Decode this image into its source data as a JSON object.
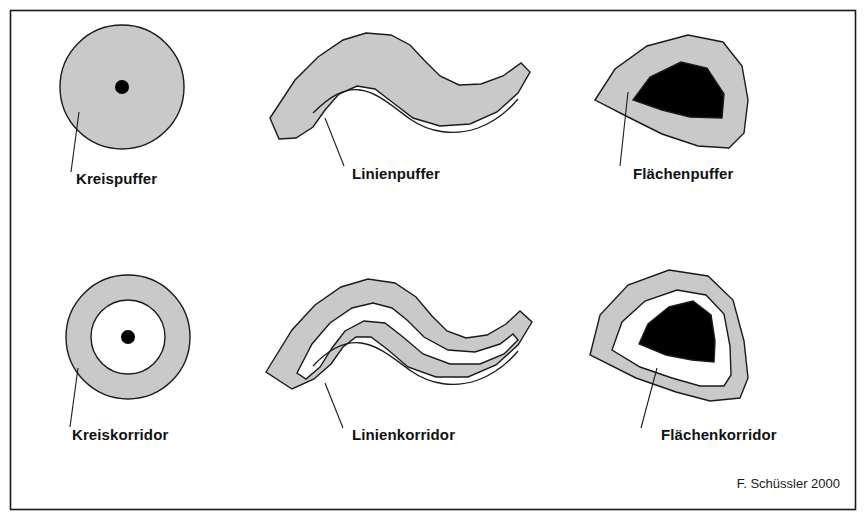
{
  "figure": {
    "credit": "F. Schüssler 2000",
    "colors": {
      "buffer_fill": "#c9c9c9",
      "core_fill": "#000000",
      "corridor_gap_fill": "#ffffff",
      "outline": "#1a1a1a",
      "background": "#ffffff",
      "frame": "#1a1a1a"
    },
    "frame": {
      "x": 10,
      "y": 10,
      "width": 846,
      "height": 500
    }
  },
  "panels": [
    {
      "id": "kreispuffer",
      "label": "Kreispuffer",
      "row": "buffer",
      "geometry_type": "point-buffer",
      "label_x": 76,
      "label_y": 184,
      "leader": {
        "x1": 79,
        "y1": 112,
        "x2": 71,
        "y2": 172
      },
      "circle": {
        "cx": 122,
        "cy": 87,
        "r": 62
      },
      "point": {
        "cx": 122,
        "cy": 87,
        "r": 7
      }
    },
    {
      "id": "linienpuffer",
      "label": "Linienpuffer",
      "row": "buffer",
      "geometry_type": "line-buffer",
      "label_x": 352,
      "label_y": 179,
      "leader": {
        "x1": 325,
        "y1": 118,
        "x2": 344,
        "y2": 166
      }
    },
    {
      "id": "flaechenpuffer",
      "label": "Flächenpuffer",
      "row": "buffer",
      "geometry_type": "polygon-buffer",
      "label_x": 633,
      "label_y": 179,
      "leader": {
        "x1": 628,
        "y1": 92,
        "x2": 620,
        "y2": 166
      }
    },
    {
      "id": "kreiskorridor",
      "label": "Kreiskorridor",
      "row": "corridor",
      "geometry_type": "point-corridor",
      "label_x": 72,
      "label_y": 440,
      "leader": {
        "x1": 78,
        "y1": 368,
        "x2": 70,
        "y2": 427
      },
      "circle_outer": {
        "cx": 128,
        "cy": 337,
        "r": 62
      },
      "circle_inner": {
        "cx": 128,
        "cy": 337,
        "r": 37
      },
      "point": {
        "cx": 128,
        "cy": 337,
        "r": 7
      }
    },
    {
      "id": "linienkorridor",
      "label": "Linienkorridor",
      "row": "corridor",
      "geometry_type": "line-corridor",
      "label_x": 352,
      "label_y": 440,
      "leader": {
        "x1": 325,
        "y1": 383,
        "x2": 343,
        "y2": 428
      }
    },
    {
      "id": "flaechenkorridor",
      "label": "Flächenkorridor",
      "row": "corridor",
      "geometry_type": "polygon-corridor",
      "label_x": 661,
      "label_y": 440,
      "leader": {
        "x1": 657,
        "y1": 368,
        "x2": 641,
        "y2": 428
      }
    }
  ],
  "paths": {
    "line_buffer_outer": "M 270 118 L 295 80 L 318 57 L 343 40 L 366 33 L 391 35 L 410 45 L 424 60 L 440 76 L 459 85 L 481 84 L 503 76 L 521 63 L 530 72 L 518 93 L 497 112 L 470 124 L 440 126 L 413 118 L 392 102 L 375 89 L 357 86 L 339 94 L 325 110 L 313 127 L 296 138 L 279 139 Z",
    "line_buffer_centerline": "M 313 113 C 330 96 344 88 360 90 C 377 92 392 106 410 119 C 430 133 455 136 478 128 C 494 122 508 111 518 99",
    "line_corridor_outer": "M 266 372 L 292 330 L 315 305 L 341 287 L 368 279 L 395 283 L 416 297 L 432 316 L 447 331 L 466 338 L 487 335 L 506 324 L 520 311 L 532 322 L 518 345 L 496 365 L 468 377 L 436 377 L 408 367 L 387 349 L 371 337 L 356 337 L 343 347 L 331 364 L 314 379 L 292 389 Z",
    "line_corridor_inner": "M 297 373 L 312 344 L 330 323 L 352 308 L 373 303 L 392 308 L 407 320 L 424 337 L 448 350 L 475 352 L 500 344 L 513 334 L 518 340 L 504 354 L 480 364 L 450 364 L 423 354 L 403 337 L 385 323 L 364 321 L 345 331 L 332 348 L 320 367 L 306 379 Z",
    "line_corridor_centerline": "M 313 366 C 330 348 345 341 361 343 C 378 345 393 358 411 371 C 431 385 455 388 478 380 C 494 374 508 363 518 351",
    "polygon_buffer_outer": "M 595 100 L 615 69 L 647 46 L 688 35 L 723 42 L 742 66 L 748 100 L 744 133 L 729 148 L 698 146 L 662 134 L 628 117 Z",
    "polygon_core": "M 633 100 L 650 77 L 681 62 L 707 68 L 724 94 L 722 118 L 690 117 L 662 110 Z",
    "polygon_corridor_outer": "M 590 355 L 600 315 L 628 285 L 669 270 L 708 276 L 733 300 L 744 341 L 748 378 L 740 398 L 710 401 L 676 392 L 636 378 Z",
    "polygon_corridor_mid": "M 612 350 L 622 322 L 645 301 L 677 290 L 706 295 L 724 314 L 730 346 L 731 375 L 724 386 L 700 386 L 672 378 L 640 367 Z",
    "polygon_corridor_core": "M 639 344 L 648 324 L 669 307 L 693 301 L 711 315 L 715 341 L 714 362 L 692 360 L 666 355 Z"
  }
}
